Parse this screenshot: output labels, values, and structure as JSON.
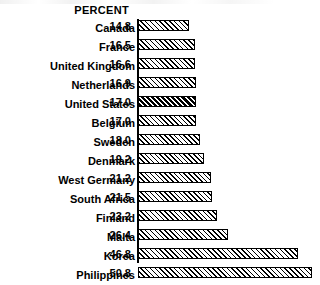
{
  "chart_data": {
    "type": "bar",
    "orientation": "horizontal",
    "title": "",
    "xlabel": "",
    "ylabel": "",
    "value_header": "PERCENT",
    "xlim": [
      0,
      50.8
    ],
    "grid": false,
    "legend": false,
    "highlighted_category": "United States",
    "categories": [
      "Canada",
      "France",
      "United Kingdom",
      "Netherlands",
      "United States",
      "Belgium",
      "Sweden",
      "Denmark",
      "West Germany",
      "South Africa",
      "Finland",
      "Malta",
      "Korea",
      "Philippines"
    ],
    "values": [
      14.8,
      16.5,
      16.6,
      16.9,
      17.0,
      17.0,
      18.0,
      19.2,
      21.2,
      21.5,
      23.2,
      26.4,
      46.8,
      50.8
    ],
    "value_labels": [
      "14.8",
      "16.5",
      "16.6",
      "16.9",
      "17.0",
      "17.0",
      "18.0",
      "19.2",
      "21.2",
      "21.5",
      "23.2",
      "26.4",
      "46.8",
      "50.8"
    ],
    "rows": [
      {
        "category": "Canada",
        "value": 14.8,
        "label": "14.8",
        "highlight": false
      },
      {
        "category": "France",
        "value": 16.5,
        "label": "16.5",
        "highlight": false
      },
      {
        "category": "United Kingdom",
        "value": 16.6,
        "label": "16.6",
        "highlight": false
      },
      {
        "category": "Netherlands",
        "value": 16.9,
        "label": "16.9",
        "highlight": false
      },
      {
        "category": "United States",
        "value": 17.0,
        "label": "17.0",
        "highlight": true
      },
      {
        "category": "Belgium",
        "value": 17.0,
        "label": "17.0",
        "highlight": false
      },
      {
        "category": "Sweden",
        "value": 18.0,
        "label": "18.0",
        "highlight": false
      },
      {
        "category": "Denmark",
        "value": 19.2,
        "label": "19.2",
        "highlight": false
      },
      {
        "category": "West Germany",
        "value": 21.2,
        "label": "21.2",
        "highlight": false
      },
      {
        "category": "South Africa",
        "value": 21.5,
        "label": "21.5",
        "highlight": false
      },
      {
        "category": "Finland",
        "value": 23.2,
        "label": "23.2",
        "highlight": false
      },
      {
        "category": "Malta",
        "value": 26.4,
        "label": "26.4",
        "highlight": false
      },
      {
        "category": "Korea",
        "value": 46.8,
        "label": "46.8",
        "highlight": false
      },
      {
        "category": "Philippines",
        "value": 50.8,
        "label": "50.8",
        "highlight": false
      }
    ],
    "style": {
      "bar_fill": "#ffffff",
      "bar_border": "#000000",
      "hatch": "diagonal-forward",
      "text_color": "#000000",
      "background": "#ffffff"
    }
  }
}
